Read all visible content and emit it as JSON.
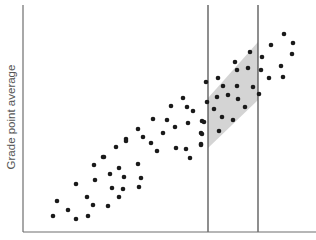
{
  "chart_data": {
    "type": "scatter",
    "title": "",
    "xlabel": "",
    "ylabel": "Grade point average",
    "grid": false,
    "legend": null,
    "colors": {
      "axis": "#6e6e6e",
      "point": "#1a1a1a",
      "band": "#d4d4d4",
      "guide_line": "#444444"
    },
    "axes_px": {
      "x0": 23,
      "y0": 232,
      "x1": 316,
      "y1": 5
    },
    "guide_lines_x_px": [
      208,
      258
    ],
    "shaded_band_px": [
      [
        208,
        98
      ],
      [
        258,
        42
      ],
      [
        258,
        100
      ],
      [
        208,
        148
      ]
    ],
    "points_px": [
      [
        53,
        216
      ],
      [
        57,
        201
      ],
      [
        68,
        210
      ],
      [
        76,
        219
      ],
      [
        76,
        184
      ],
      [
        87,
        197
      ],
      [
        88,
        216
      ],
      [
        93,
        205
      ],
      [
        94,
        165
      ],
      [
        95,
        180
      ],
      [
        103,
        157
      ],
      [
        104,
        157
      ],
      [
        108,
        206
      ],
      [
        110,
        174
      ],
      [
        112,
        188
      ],
      [
        116,
        147
      ],
      [
        119,
        168
      ],
      [
        119,
        197
      ],
      [
        123,
        189
      ],
      [
        124,
        177
      ],
      [
        126,
        139
      ],
      [
        126,
        141
      ],
      [
        138,
        129
      ],
      [
        138,
        164
      ],
      [
        139,
        187
      ],
      [
        141,
        178
      ],
      [
        143,
        137
      ],
      [
        151,
        143
      ],
      [
        153,
        119
      ],
      [
        157,
        151
      ],
      [
        163,
        133
      ],
      [
        167,
        120
      ],
      [
        171,
        106
      ],
      [
        175,
        127
      ],
      [
        176,
        148
      ],
      [
        183,
        98
      ],
      [
        186,
        149
      ],
      [
        187,
        107
      ],
      [
        188,
        123
      ],
      [
        190,
        158
      ],
      [
        193,
        111
      ],
      [
        201,
        133
      ],
      [
        201,
        144
      ],
      [
        201,
        145
      ],
      [
        202,
        121
      ],
      [
        202,
        134
      ],
      [
        204,
        122
      ],
      [
        206,
        82
      ],
      [
        207,
        102
      ],
      [
        214,
        109
      ],
      [
        217,
        97
      ],
      [
        218,
        78
      ],
      [
        219,
        131
      ],
      [
        222,
        117
      ],
      [
        223,
        86
      ],
      [
        228,
        95
      ],
      [
        233,
        120
      ],
      [
        235,
        62
      ],
      [
        237,
        70
      ],
      [
        237,
        86
      ],
      [
        238,
        99
      ],
      [
        245,
        107
      ],
      [
        248,
        68
      ],
      [
        250,
        52
      ],
      [
        253,
        87
      ],
      [
        259,
        94
      ],
      [
        261,
        70
      ],
      [
        262,
        57
      ],
      [
        269,
        78
      ],
      [
        271,
        45
      ],
      [
        281,
        66
      ],
      [
        283,
        77
      ],
      [
        284,
        34
      ],
      [
        292,
        54
      ],
      [
        293,
        43
      ]
    ]
  }
}
